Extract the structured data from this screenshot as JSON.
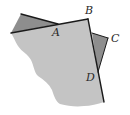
{
  "figure": {
    "colors": {
      "sheet": "#c4c4c4",
      "flap": "#8e8e8e",
      "edge": "#1a1a1a"
    },
    "labels": {
      "A": "A",
      "B": "B",
      "C": "C",
      "D": "D"
    }
  }
}
